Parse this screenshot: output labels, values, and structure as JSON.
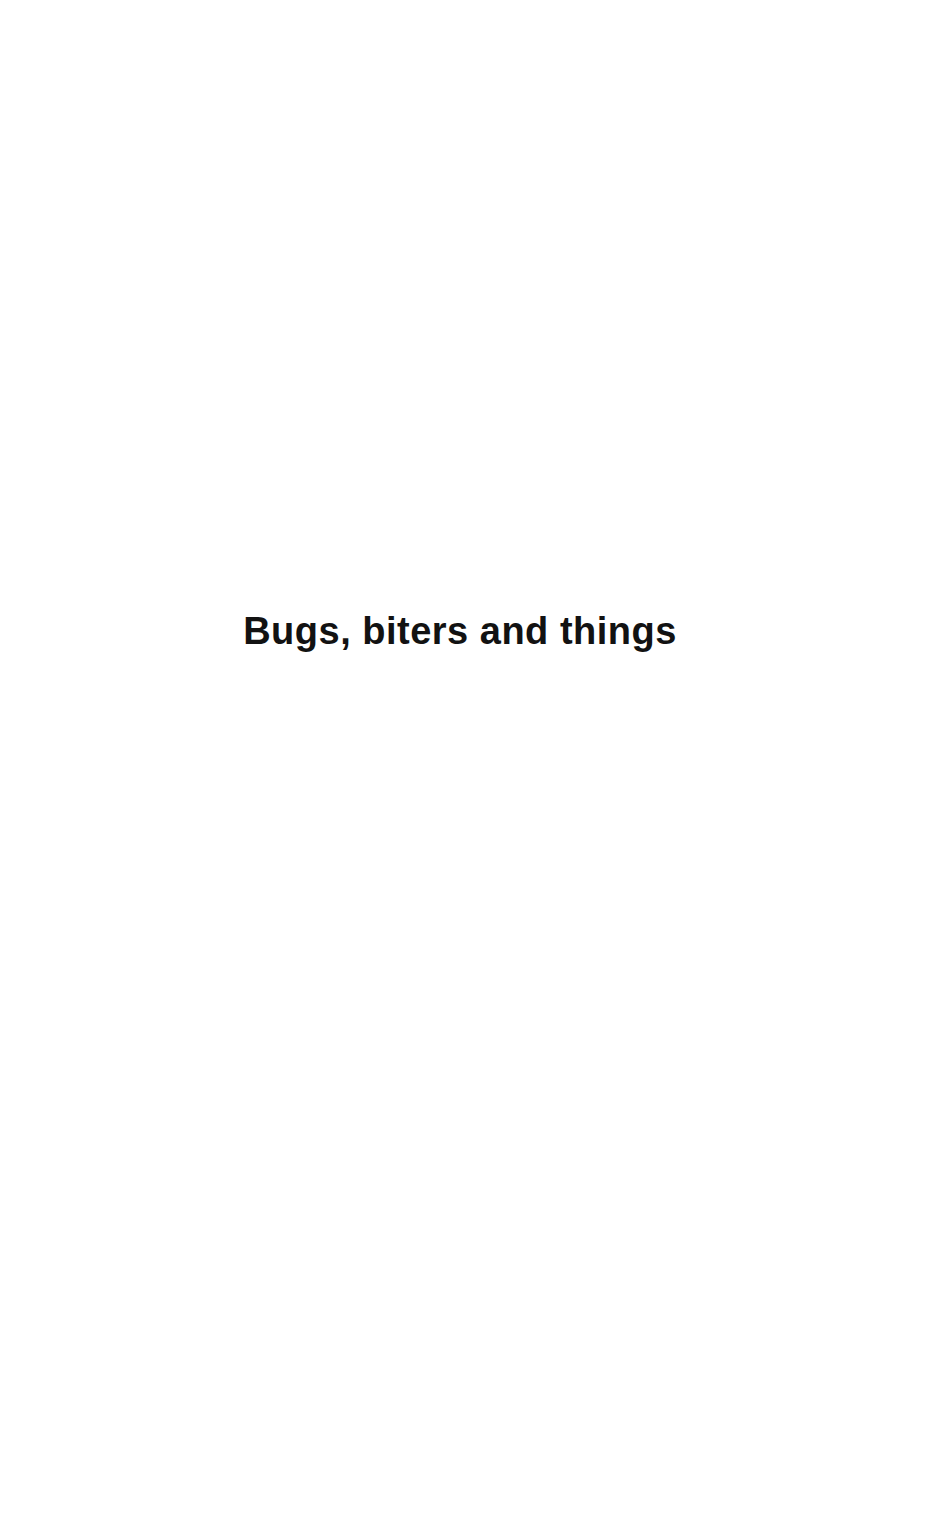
{
  "page": {
    "kind": "book-title-page",
    "background_color": "#ffffff",
    "text_color": "#121212",
    "title": "Bugs, biters and things"
  }
}
